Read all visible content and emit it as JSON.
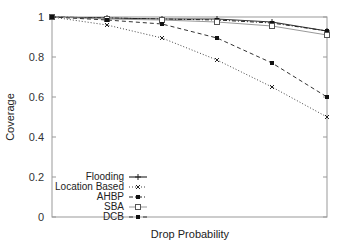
{
  "chart_data": {
    "type": "line",
    "title": "",
    "xlabel": "Drop Probability",
    "ylabel": "Coverage",
    "x": [
      0,
      1,
      2,
      3,
      4,
      5
    ],
    "xticks_shown": false,
    "ylim": [
      0,
      1
    ],
    "yticks": [
      "0",
      "0.2",
      "0.4",
      "0.6",
      "0.8",
      "1"
    ],
    "grid": false,
    "legend_position": "lower left",
    "series": [
      {
        "name": "Flooding",
        "style": "solid",
        "marker": "plus",
        "values": [
          1.0,
          0.995,
          0.99,
          0.99,
          0.975,
          0.93
        ]
      },
      {
        "name": "Location Based",
        "style": "dotted",
        "marker": "cross",
        "values": [
          1.0,
          0.96,
          0.895,
          0.785,
          0.65,
          0.5
        ]
      },
      {
        "name": "AHBP",
        "style": "dashdot",
        "marker": "filled-square",
        "values": [
          1.0,
          0.995,
          0.99,
          0.985,
          0.97,
          0.93
        ]
      },
      {
        "name": "SBA",
        "style": "solid-light",
        "marker": "open-square",
        "values": [
          1.0,
          0.99,
          0.985,
          0.975,
          0.955,
          0.91
        ]
      },
      {
        "name": "DCB",
        "style": "dashed",
        "marker": "filled-square",
        "values": [
          1.0,
          0.985,
          0.965,
          0.895,
          0.77,
          0.6
        ]
      }
    ]
  },
  "axes": {
    "xlabel": "Drop Probability",
    "ylabel": "Coverage",
    "yticks": [
      "0",
      "0.2",
      "0.4",
      "0.6",
      "0.8",
      "1"
    ]
  },
  "legend": {
    "items": [
      {
        "label": "Flooding"
      },
      {
        "label": "Location Based"
      },
      {
        "label": "AHBP"
      },
      {
        "label": "SBA"
      },
      {
        "label": "DCB"
      }
    ]
  }
}
